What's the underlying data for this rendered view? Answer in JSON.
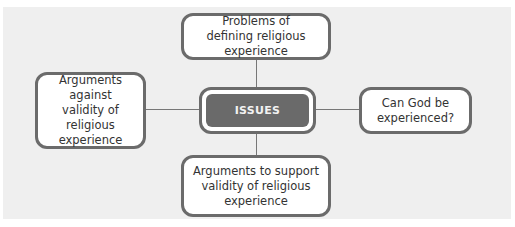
{
  "diagram": {
    "center": {
      "label": "ISSUES"
    },
    "nodes": [
      {
        "id": "top",
        "label": "Problems of defining religious experience"
      },
      {
        "id": "left",
        "label": "Arguments against validity of religious experience"
      },
      {
        "id": "right",
        "label": "Can God be experienced?"
      },
      {
        "id": "bottom",
        "label": "Arguments to support validity of religious experience"
      }
    ]
  },
  "colors": {
    "background": "#efefef",
    "box_border": "#6b6b6b",
    "center_fill": "#6a6a6a",
    "connector": "#777777"
  }
}
